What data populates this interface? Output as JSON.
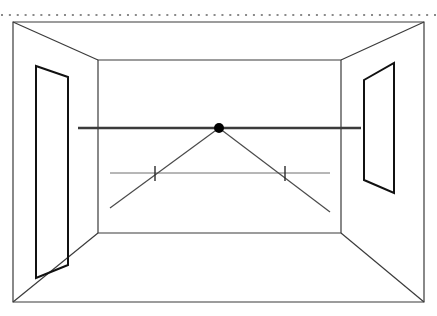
{
  "document": {
    "title": "One-Point Perspective Room",
    "background_color": "#ffffff",
    "width": 437,
    "height": 316
  },
  "style": {
    "stroke_dark": "#1a1a1a",
    "stroke_medium": "#3b3b3b",
    "stroke_light": "#6e6e6e",
    "dotted_color": "#8a8a8a",
    "vanishing_point_fill": "#000000",
    "outer_frame_width": 1.2,
    "wall_line_width": 1.2,
    "opening_line_width": 2.0,
    "horizon_line_width": 2.4,
    "ray_line_width": 1.2,
    "guide_line_width": 1.0
  },
  "chart_data": {
    "type": "diagram",
    "title": "One-Point Perspective Room",
    "xlabel": "",
    "ylabel": "",
    "coordinate_space": {
      "x_range": [
        0,
        437
      ],
      "y_range": [
        0,
        316
      ]
    },
    "elements": [
      {
        "name": "dotted-guide-line",
        "kind": "dotted-line",
        "x1": 2,
        "y1": 15,
        "x2": 435,
        "y2": 15,
        "dot_count": 56,
        "color": "#8a8a8a"
      },
      {
        "name": "outer-picture-plane",
        "kind": "rectangle",
        "points": [
          [
            13,
            22
          ],
          [
            424,
            22
          ],
          [
            424,
            302
          ],
          [
            13,
            302
          ]
        ],
        "color": "#3b3b3b"
      },
      {
        "name": "back-wall",
        "kind": "rectangle",
        "points": [
          [
            98,
            60
          ],
          [
            341,
            60
          ],
          [
            341,
            233
          ],
          [
            98,
            233
          ]
        ],
        "color": "#3b3b3b"
      },
      {
        "name": "ceiling-edge-left",
        "kind": "line",
        "x1": 13,
        "y1": 22,
        "x2": 98,
        "y2": 60,
        "color": "#3b3b3b"
      },
      {
        "name": "ceiling-edge-right",
        "kind": "line",
        "x1": 424,
        "y1": 22,
        "x2": 341,
        "y2": 60,
        "color": "#3b3b3b"
      },
      {
        "name": "floor-edge-left",
        "kind": "line",
        "x1": 13,
        "y1": 302,
        "x2": 98,
        "y2": 233,
        "color": "#3b3b3b"
      },
      {
        "name": "floor-edge-right",
        "kind": "line",
        "x1": 424,
        "y1": 302,
        "x2": 341,
        "y2": 233,
        "color": "#3b3b3b"
      },
      {
        "name": "left-wall-door",
        "kind": "quadrilateral",
        "points": [
          [
            36,
            66
          ],
          [
            68,
            77
          ],
          [
            68,
            265
          ],
          [
            36,
            278
          ]
        ],
        "color": "#111111"
      },
      {
        "name": "right-wall-window",
        "kind": "quadrilateral",
        "points": [
          [
            364,
            80
          ],
          [
            394,
            63
          ],
          [
            394,
            193
          ],
          [
            364,
            180
          ]
        ],
        "color": "#111111"
      },
      {
        "name": "horizon-line",
        "kind": "line",
        "x1": 78,
        "y1": 128,
        "x2": 361,
        "y2": 128,
        "color": "#3b3b3b"
      },
      {
        "name": "vanishing-point",
        "kind": "point",
        "cx": 219,
        "cy": 128,
        "r": 5,
        "color": "#000000"
      },
      {
        "name": "perspective-ray-left",
        "kind": "line",
        "x1": 219,
        "y1": 128,
        "x2": 110,
        "y2": 208,
        "color": "#4a4a4a"
      },
      {
        "name": "perspective-ray-right",
        "kind": "line",
        "x1": 219,
        "y1": 128,
        "x2": 330,
        "y2": 212,
        "color": "#4a4a4a"
      },
      {
        "name": "measuring-line",
        "kind": "line",
        "x1": 110,
        "y1": 173,
        "x2": 330,
        "y2": 173,
        "color": "#6e6e6e"
      },
      {
        "name": "tick-mark-left",
        "kind": "tick",
        "x": 155,
        "y1": 166,
        "y2": 181,
        "color": "#2b2b2b"
      },
      {
        "name": "tick-mark-right",
        "kind": "tick",
        "x": 285,
        "y1": 166,
        "y2": 181,
        "color": "#2b2b2b"
      }
    ],
    "annotations": [],
    "legend": [],
    "grid": false
  },
  "labels": {
    "vanishing_point": "",
    "horizon": "",
    "caption": ""
  }
}
